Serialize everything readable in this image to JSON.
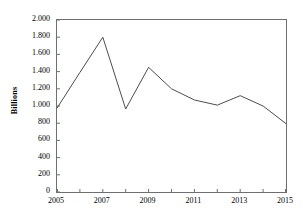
{
  "chart_data": {
    "type": "line",
    "title": "",
    "subtitle": "",
    "xlabel": "",
    "ylabel": "Billions",
    "x": [
      2005,
      2006,
      2007,
      2008,
      2009,
      2010,
      2011,
      2012,
      2013,
      2014,
      2015
    ],
    "values": [
      975,
      1390,
      1800,
      965,
      1450,
      1200,
      1070,
      1010,
      1120,
      1000,
      795
    ],
    "series": [
      {
        "name": "Billions",
        "values": [
          975,
          1390,
          1800,
          965,
          1450,
          1200,
          1070,
          1010,
          1120,
          1000,
          795
        ]
      }
    ],
    "xlim": [
      2005,
      2015
    ],
    "ylim": [
      0,
      2000
    ],
    "grid": false,
    "legend": false,
    "legend_position": "none",
    "line_color": "#4d4d4d",
    "axis_color": "#6f6f6f",
    "y_ticks": [
      0,
      200,
      400,
      600,
      800,
      1000,
      1200,
      1400,
      1600,
      1800,
      2000
    ],
    "y_tick_labels": [
      "0",
      "200",
      "400",
      "600",
      "800",
      "1.000",
      "1.200",
      "1.400",
      "1.600",
      "1.800",
      "2.000"
    ],
    "x_ticks_major": [
      2005,
      2007,
      2009,
      2011,
      2013,
      2015
    ],
    "x_tick_labels": [
      "2005",
      "2007",
      "2009",
      "2011",
      "2013",
      "2015"
    ],
    "x_ticks_minor": [
      2006,
      2008,
      2010,
      2012,
      2014
    ]
  }
}
